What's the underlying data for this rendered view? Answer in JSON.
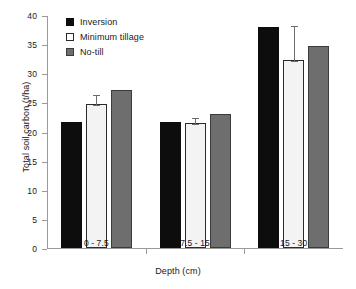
{
  "chart_data": {
    "type": "bar",
    "title": "",
    "xlabel": "Depth (cm)",
    "ylabel": "Total soil carbon (t/ha)",
    "categories": [
      "0 - 7.5",
      "7.5 - 15",
      "15 - 30"
    ],
    "ylim": [
      0,
      40
    ],
    "yticks": [
      0,
      5,
      10,
      15,
      20,
      25,
      30,
      35,
      40
    ],
    "ytick_labels": [
      "0",
      "5",
      "10",
      "15",
      "20",
      "25",
      "30",
      "35",
      "40"
    ],
    "grid": false,
    "legend_position": "top-left",
    "series": [
      {
        "name": "Inversion",
        "color": "#0d0d0d",
        "values": [
          21.6,
          21.6,
          38.0
        ],
        "errors": [
          null,
          null,
          null
        ]
      },
      {
        "name": "Minimum tillage",
        "color": "#f3f3f3",
        "values": [
          24.7,
          21.5,
          32.2
        ],
        "errors": [
          1.7,
          1.0,
          6.0
        ]
      },
      {
        "name": "No-till",
        "color": "#6e6e6e",
        "values": [
          27.2,
          23.0,
          34.7
        ],
        "errors": [
          null,
          null,
          null
        ]
      }
    ]
  },
  "legend": {
    "items": [
      {
        "label": "Inversion",
        "swatch": "black-square-icon"
      },
      {
        "label": "Minimum tillage",
        "swatch": "white-square-icon"
      },
      {
        "label": "No-till",
        "swatch": "gray-square-icon"
      }
    ]
  }
}
